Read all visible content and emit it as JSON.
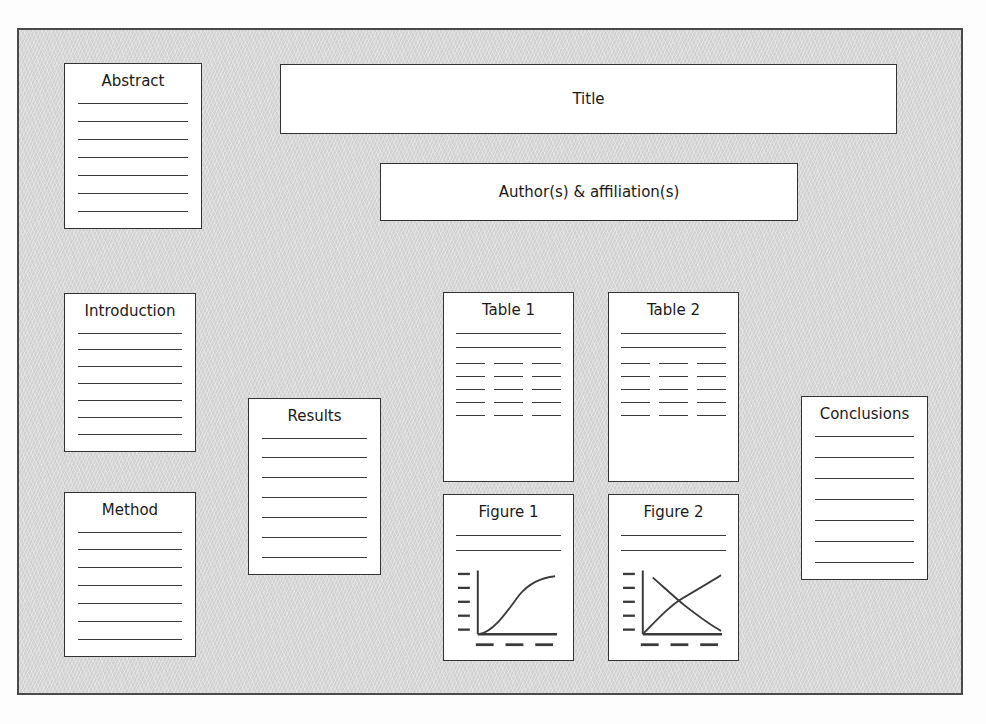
{
  "poster": {
    "background_color": "#d6d6d6",
    "panel_color": "#ffffff",
    "border_color": "#333333",
    "panels": {
      "abstract": {
        "title": "Abstract",
        "line_count": 7
      },
      "title": {
        "title": "Title"
      },
      "authors": {
        "title": "Author(s) & affiliation(s)"
      },
      "introduction": {
        "title": "Introduction",
        "line_count": 7
      },
      "method": {
        "title": "Method",
        "line_count": 7
      },
      "results": {
        "title": "Results",
        "line_count": 7
      },
      "conclusions": {
        "title": "Conclusions",
        "line_count": 7
      },
      "table1": {
        "title": "Table 1",
        "header_rule_count": 2,
        "body_row_count": 5,
        "columns_per_row": 3
      },
      "table2": {
        "title": "Table 2",
        "header_rule_count": 2,
        "body_row_count": 5,
        "columns_per_row": 3
      },
      "figure1": {
        "title": "Figure 1",
        "caption_line_count": 2,
        "chart": {
          "type": "line",
          "series": [
            {
              "name": "curve-1",
              "points": [
                [
                  0,
                  0
                ],
                [
                  12,
                  34
                ],
                [
                  26,
                  55
                ],
                [
                  44,
                  70
                ],
                [
                  66,
                  79
                ],
                [
                  88,
                  83
                ],
                [
                  100,
                  84
                ]
              ]
            }
          ],
          "y_tick_count": 5,
          "x_tick_count": 3,
          "grid": false
        }
      },
      "figure2": {
        "title": "Figure 2",
        "caption_line_count": 2,
        "chart": {
          "type": "line",
          "series": [
            {
              "name": "rising-curve",
              "points": [
                [
                  0,
                  0
                ],
                [
                  16,
                  26
                ],
                [
                  34,
                  46
                ],
                [
                  56,
                  62
                ],
                [
                  78,
                  75
                ],
                [
                  100,
                  88
                ]
              ]
            },
            {
              "name": "falling-curve",
              "points": [
                [
                  10,
                  84
                ],
                [
                  28,
                  66
                ],
                [
                  46,
                  52
                ],
                [
                  64,
                  38
                ],
                [
                  82,
                  20
                ],
                [
                  100,
                  8
                ]
              ]
            }
          ],
          "y_tick_count": 5,
          "x_tick_count": 3,
          "grid": false
        }
      }
    }
  }
}
